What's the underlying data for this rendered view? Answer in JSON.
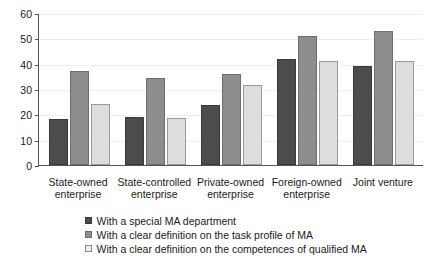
{
  "chart_data": {
    "type": "bar",
    "title": "",
    "subtitle": "",
    "xlabel": "",
    "ylabel": "",
    "ylim": [
      0,
      60
    ],
    "ytick_step": 10,
    "yticks": [
      0,
      10,
      20,
      30,
      40,
      50,
      60
    ],
    "ytick_labels": [
      "0",
      "10",
      "20",
      "30",
      "40",
      "50",
      "60"
    ],
    "grid": true,
    "grid_axis": "y",
    "legend_position": "bottom",
    "orientation": "vertical",
    "grouping": "grouped",
    "categories": [
      "State-owned enterprise",
      "State-controlled enterprise",
      "Private-owned enterprise",
      "Foreign-owned enterprise",
      "Joint venture"
    ],
    "category_lines": [
      [
        "State-owned",
        "enterprise"
      ],
      [
        "State-controlled",
        "enterprise"
      ],
      [
        "Private-owned",
        "enterprise"
      ],
      [
        "Foreign-owned",
        "enterprise"
      ],
      [
        "Joint venture",
        ""
      ]
    ],
    "series": [
      {
        "name": "With a special MA department",
        "color": "#4c4c4c",
        "values": [
          18,
          19,
          23.5,
          42,
          39
        ]
      },
      {
        "name": "With a clear definition on the task profile of MA",
        "color": "#8d8d8d",
        "values": [
          37,
          34.5,
          36,
          51,
          53
        ]
      },
      {
        "name": "With a clear definition on the competences of qualified MA",
        "color": "#dddddd",
        "values": [
          24,
          18.5,
          31.5,
          41,
          41
        ]
      }
    ],
    "legend": [
      "With a special MA department",
      "With a clear definition on the task profile of MA",
      "With a clear definition on the competences of qualified MA"
    ],
    "colors": {
      "series_0": "#4c4c4c",
      "series_1": "#8d8d8d",
      "series_2": "#dddddd",
      "axis": "#555555",
      "grid": "#eeeeee",
      "text": "#1a1a1a",
      "background": "#ffffff"
    }
  }
}
